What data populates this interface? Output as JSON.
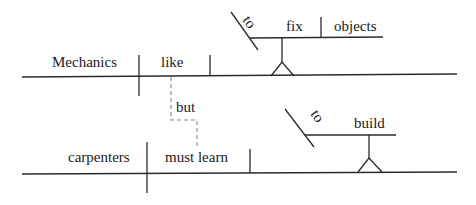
{
  "diagram": {
    "type": "sentence-diagram (Reed-Kellogg)",
    "sentence_1": {
      "subject": "Mechanics",
      "verb": "like",
      "object_infinitive": {
        "marker": "to",
        "verb": "fix",
        "object": "objects"
      }
    },
    "conjunction": "but",
    "sentence_2": {
      "subject": "carpenters",
      "verb": "must learn",
      "object_infinitive": {
        "marker": "to",
        "verb": "build"
      }
    },
    "colors": {
      "line": "#2a2a2a",
      "dashed_connector": "#8a8a8a",
      "text": "#1a1a1a",
      "background": "#ffffff"
    }
  }
}
